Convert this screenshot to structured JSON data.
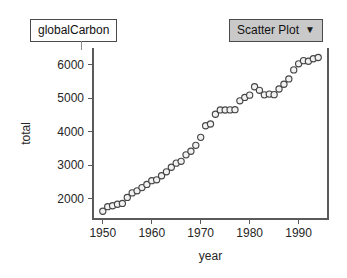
{
  "collection": {
    "label": "globalCarbon"
  },
  "plot_type_menu": {
    "label": "Scatter Plot",
    "caret_icon": "triangle-down-icon",
    "caret_glyph": "▼",
    "background_color": "#c9c9c9",
    "border_color": "#4a4a4a"
  },
  "chart_data": {
    "type": "scatter",
    "title": "",
    "xlabel": "year",
    "ylabel": "total",
    "xlim": [
      1948,
      1996
    ],
    "ylim": [
      1400,
      6500
    ],
    "xticks": [
      1950,
      1960,
      1970,
      1980,
      1990
    ],
    "yticks": [
      2000,
      3000,
      4000,
      5000,
      6000
    ],
    "xtick_labels": [
      "1950",
      "1960",
      "1970",
      "1980",
      "1990"
    ],
    "ytick_labels": [
      "2000",
      "3000",
      "4000",
      "5000",
      "6000"
    ],
    "grid": false,
    "legend": false,
    "marker": "open-circle",
    "marker_fill": "#f2f2f2",
    "marker_stroke": "#454545",
    "series": [
      {
        "name": "total",
        "x": [
          1950,
          1951,
          1952,
          1953,
          1954,
          1955,
          1956,
          1957,
          1958,
          1959,
          1960,
          1961,
          1962,
          1963,
          1964,
          1965,
          1966,
          1967,
          1968,
          1969,
          1970,
          1971,
          1972,
          1973,
          1974,
          1975,
          1976,
          1977,
          1978,
          1979,
          1980,
          1981,
          1982,
          1983,
          1984,
          1985,
          1986,
          1987,
          1988,
          1989,
          1990,
          1991,
          1992,
          1993,
          1994
        ],
        "y": [
          1630,
          1767,
          1795,
          1841,
          1865,
          2043,
          2179,
          2240,
          2336,
          2431,
          2543,
          2569,
          2690,
          2807,
          2942,
          3066,
          3120,
          3313,
          3420,
          3596,
          3835,
          4182,
          4233,
          4524,
          4653,
          4651,
          4654,
          4660,
          4924,
          5026,
          5094,
          5345,
          5237,
          5102,
          5125,
          5109,
          5278,
          5418,
          5577,
          5847,
          6028,
          6123,
          6104,
          6178,
          6216
        ]
      }
    ]
  },
  "geometry": {
    "plot_left": 93,
    "plot_right": 328,
    "plot_top": 48,
    "plot_bottom": 219,
    "x_min": 1948,
    "x_max": 1996,
    "y_min": 1400,
    "y_max": 6500
  }
}
